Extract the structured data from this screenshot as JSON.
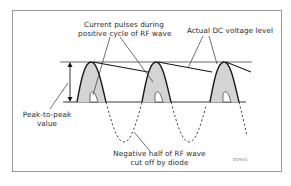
{
  "diagram": {
    "labels": {
      "current_pulses_line1": "Current pulses during",
      "current_pulses_line2": "positive cycle of RF wave",
      "dc_level": "Actual DC voltage level",
      "peak_to_peak_line1": "Peak-to-peak",
      "peak_to_peak_line2": "value",
      "negative_half_line1": "Negative half of RF wave",
      "negative_half_line2": "cut off by diode"
    },
    "figure_code": "D0903",
    "colors": {
      "frame": "#9a9a9a",
      "line": "#1a1a1a",
      "pulse_fill": "#d4d4d4",
      "text": "#2a2a2a"
    },
    "pulses": [
      {
        "peak_x": 91,
        "peak_y": 62
      },
      {
        "peak_x": 156,
        "peak_y": 62
      },
      {
        "peak_x": 224,
        "peak_y": 62
      }
    ],
    "levels": {
      "peak_y": 62,
      "baseline_y": 102,
      "negative_trough_y": 142
    }
  }
}
